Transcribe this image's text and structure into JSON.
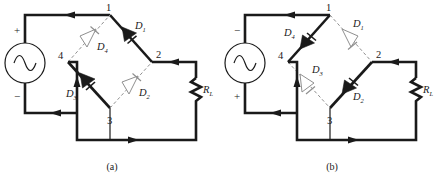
{
  "figure": {
    "type": "bridge-rectifier-two-panels",
    "stroke_color": "#1a1a1a",
    "dashed_color": "#8c8c8c",
    "background": "#ffffff"
  },
  "panel_a": {
    "caption": "(a)",
    "source": {
      "name": "ac-source",
      "symbol": "sine",
      "top_polarity": "+",
      "bottom_polarity": "−"
    },
    "nodes": [
      {
        "id": "1",
        "label": "1"
      },
      {
        "id": "2",
        "label": "2"
      },
      {
        "id": "3",
        "label": "3"
      },
      {
        "id": "4",
        "label": "4"
      }
    ],
    "diodes": [
      {
        "id": "D1",
        "label": "D",
        "sub": "1",
        "state": "conducting"
      },
      {
        "id": "D2",
        "label": "D",
        "sub": "2",
        "state": "off"
      },
      {
        "id": "D3",
        "label": "D",
        "sub": "3",
        "state": "conducting"
      },
      {
        "id": "D4",
        "label": "D",
        "sub": "4",
        "state": "off"
      }
    ],
    "load": {
      "label": "R",
      "sub": "L",
      "symbol": "resistor-zigzag"
    },
    "current_arrows": 5
  },
  "panel_b": {
    "caption": "(b)",
    "source": {
      "name": "ac-source",
      "symbol": "sine",
      "top_polarity": "−",
      "bottom_polarity": "+"
    },
    "nodes": [
      {
        "id": "1",
        "label": "1"
      },
      {
        "id": "2",
        "label": "2"
      },
      {
        "id": "3",
        "label": "3"
      },
      {
        "id": "4",
        "label": "4"
      }
    ],
    "diodes": [
      {
        "id": "D1",
        "label": "D",
        "sub": "1",
        "state": "off"
      },
      {
        "id": "D2",
        "label": "D",
        "sub": "2",
        "state": "conducting"
      },
      {
        "id": "D3",
        "label": "D",
        "sub": "3",
        "state": "off"
      },
      {
        "id": "D4",
        "label": "D",
        "sub": "4",
        "state": "conducting"
      }
    ],
    "load": {
      "label": "R",
      "sub": "L",
      "symbol": "resistor-zigzag"
    },
    "current_arrows": 5
  }
}
